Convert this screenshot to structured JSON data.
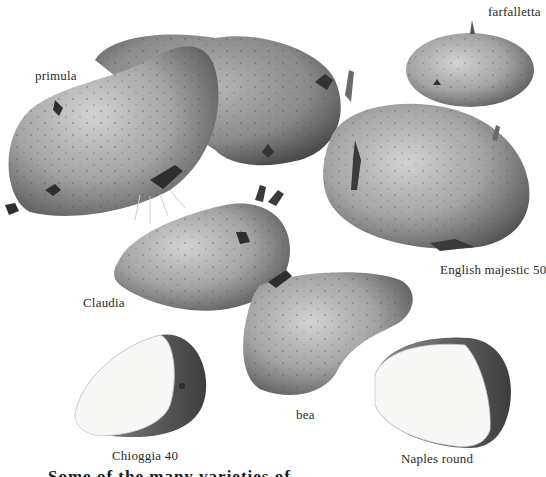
{
  "illustration": {
    "subject": "potato varieties",
    "style": "grayscale botanical illustration",
    "colors": {
      "background": "#ffffff",
      "skin_light": "#c9c9c9",
      "skin_mid": "#9a9a9a",
      "skin_dark": "#4a4a4a",
      "flesh": "#f7f7f5",
      "sprout": "#3a3a3a",
      "label_text": "#2a2a2a"
    },
    "potatoes": [
      {
        "id": "primula",
        "label": "primula",
        "type": "whole",
        "count": 2
      },
      {
        "id": "farfalletta",
        "label": "farfalletta",
        "type": "whole"
      },
      {
        "id": "english-majestic-50",
        "label": "English majestic 50",
        "type": "whole"
      },
      {
        "id": "claudia",
        "label": "Claudia",
        "type": "whole"
      },
      {
        "id": "bea",
        "label": "bea",
        "type": "whole"
      },
      {
        "id": "chioggia-40",
        "label": "Chioggia 40",
        "type": "cut"
      },
      {
        "id": "naples-round",
        "label": "Naples round",
        "type": "cut"
      }
    ]
  },
  "footer": {
    "cropped_text": "Some of the many varieties of..."
  }
}
